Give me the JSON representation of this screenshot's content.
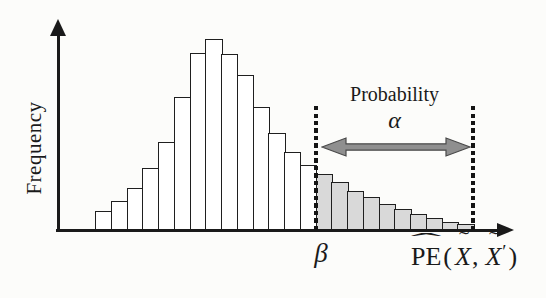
{
  "chart_data": {
    "type": "bar",
    "title": "",
    "ylabel": "Frequency",
    "xlabel": "PE(X~, X~')",
    "values": [
      19,
      29,
      42,
      62,
      88,
      133,
      177,
      191,
      176,
      155,
      123,
      97,
      78,
      65,
      56,
      48,
      39,
      33,
      26,
      21,
      16,
      12,
      8,
      6
    ],
    "shaded_start_index": 14,
    "bar_count": 24,
    "legend": "none",
    "grid": false,
    "y_axis_tick_labels": [],
    "x_axis_tick_labels": [],
    "threshold_label": "β",
    "annotation": {
      "line1": "Probability",
      "line2": "α"
    },
    "xlabel_parts": {
      "hat_base": "PE",
      "hat_glyph": "ˆ",
      "open_paren": "(",
      "x_first": "X",
      "tilde_glyph": "˜",
      "comma": ",",
      "x_second": "X",
      "prime": "′",
      "close_paren": ")"
    },
    "colors": {
      "bar_outline": "#1f1f1f",
      "unshaded_fill": "#ffffff",
      "shaded_fill": "#d9d9d9",
      "axis": "#1a1a1a",
      "arrow_fill": "#8f8f8f",
      "arrow_outline": "#4a4a4a",
      "dotted_line": "#141414",
      "text": "#1a1a1a",
      "background": "#fcfcfa"
    },
    "layout": {
      "shaded_region": "right tail between two vertical dotted lines",
      "arrow": "horizontal double-headed arrow spanning shaded region"
    }
  }
}
